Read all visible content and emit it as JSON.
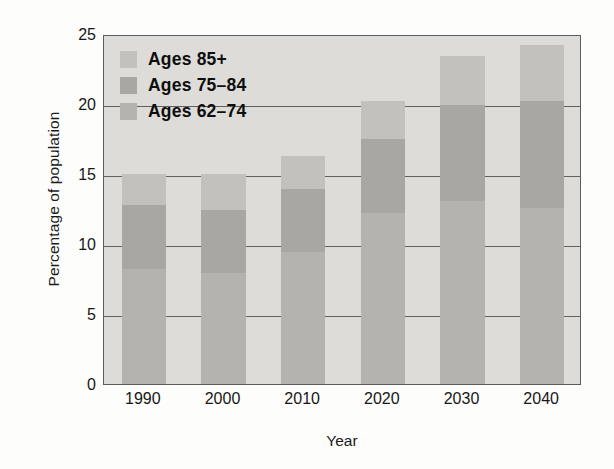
{
  "chart_data": {
    "type": "bar",
    "subtype": "stacked-bar",
    "title": "",
    "xlabel": "Year",
    "ylabel": "Percentage of population",
    "categories": [
      "1990",
      "2000",
      "2010",
      "2020",
      "2030",
      "2040"
    ],
    "series": [
      {
        "name": "Ages 62–74",
        "values": [
          8.2,
          7.9,
          9.4,
          12.2,
          13.1,
          12.6
        ],
        "color": "#b4b3ae"
      },
      {
        "name": "Ages 75–84",
        "values": [
          4.6,
          4.5,
          4.5,
          5.3,
          6.8,
          7.6
        ],
        "color": "#a8a7a2"
      },
      {
        "name": "Ages 85+",
        "values": [
          2.2,
          2.6,
          2.4,
          2.7,
          3.5,
          4.0
        ],
        "color": "#c2c1bc"
      }
    ],
    "totals": [
      15.0,
      15.0,
      16.3,
      20.2,
      23.4,
      24.2
    ],
    "ylim": [
      0,
      25
    ],
    "yticks": [
      0,
      5,
      10,
      15,
      20,
      25
    ],
    "ytick_labels": [
      "0",
      "5",
      "10",
      "15",
      "20",
      "25"
    ],
    "grid": true,
    "grid_axis": "y",
    "legend_position": "top-left",
    "plot_background": "#dddcd8",
    "axis_color": "#5c5c5a"
  },
  "legend": {
    "items": [
      {
        "label": "Ages 85+",
        "swatch_class": "seg-85"
      },
      {
        "label": "Ages 75–84",
        "swatch_class": "seg-75"
      },
      {
        "label": "Ages 62–74",
        "swatch_class": "seg-62"
      }
    ]
  }
}
